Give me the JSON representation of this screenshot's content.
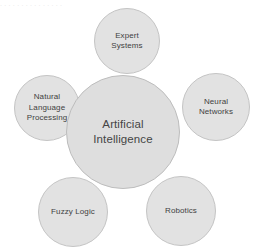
{
  "diagram": {
    "type": "hub-and-spoke-venn",
    "title_fragment_cropped": ". . .  .  .  . .   . .    .  .   .  .   .   .",
    "background_color": "#ffffff",
    "bubble_fill": "#e2e2e2",
    "bubble_stroke": "#c4c4c4",
    "center_fill": "#dedede",
    "center_stroke": "#bdbdbd",
    "text_color": "#3f3f3f",
    "center": {
      "label": "Artificial\nIntelligence",
      "cx": 123,
      "cy": 132,
      "r": 57
    },
    "nodes": [
      {
        "id": "expert-systems",
        "label": "Expert\nSystems",
        "cx": 127,
        "cy": 41,
        "r": 33
      },
      {
        "id": "natural-language-processing",
        "label": "Natural\nLanguage\nProcessing",
        "cx": 47,
        "cy": 108,
        "r": 33
      },
      {
        "id": "neural-networks",
        "label": "Neural\nNetworks",
        "cx": 216,
        "cy": 107,
        "r": 34
      },
      {
        "id": "fuzzy-logic",
        "label": "Fuzzy Logic",
        "cx": 73,
        "cy": 212,
        "r": 35
      },
      {
        "id": "robotics",
        "label": "Robotics",
        "cx": 181,
        "cy": 211,
        "r": 35
      }
    ]
  }
}
